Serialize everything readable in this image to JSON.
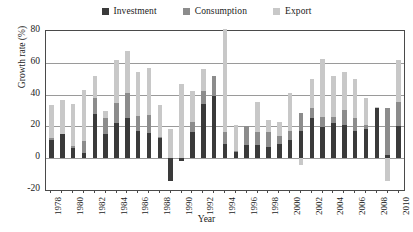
{
  "chart_data": {
    "type": "bar",
    "subtype": "stacked-column",
    "title": "",
    "xlabel": "Year",
    "ylabel": "Growth rate (%)",
    "ylim": [
      -20,
      80
    ],
    "yticks": [
      80,
      60,
      40,
      20,
      0,
      -20
    ],
    "grid": true,
    "legend_position": "top-center",
    "categories": [
      "1978",
      "1979",
      "1980",
      "1981",
      "1982",
      "1983",
      "1984",
      "1985",
      "1986",
      "1987",
      "1988",
      "1989",
      "1990",
      "1991",
      "1992",
      "1993",
      "1994",
      "1995",
      "1996",
      "1997",
      "1998",
      "1999",
      "2000",
      "2001",
      "2002",
      "2003",
      "2004",
      "2005",
      "2006",
      "2007",
      "2008",
      "2009",
      "2010"
    ],
    "xtick_labels": [
      "1978",
      "1980",
      "1982",
      "1984",
      "1986",
      "1988",
      "1990",
      "1992",
      "1994",
      "1996",
      "1998",
      "2000",
      "2002",
      "2004",
      "2006",
      "2008",
      "2010"
    ],
    "series": [
      {
        "name": "Investment",
        "color": "#3a3a3a",
        "values": [
          11.5,
          15.5,
          6.5,
          3.5,
          28.0,
          15.0,
          22.0,
          25.5,
          17.0,
          16.0,
          12.5,
          -14.5,
          -2.0,
          16.5,
          34.0,
          39.0,
          9.0,
          4.0,
          8.5,
          8.0,
          7.0,
          9.0,
          11.5,
          17.0,
          25.0,
          19.5,
          22.0,
          21.0,
          17.0,
          18.5,
          31.5,
          2.0,
          20.5
        ]
      },
      {
        "name": "Consumption",
        "color": "#8c8c8c",
        "values": [
          1.0,
          0.0,
          1.0,
          7.5,
          10.0,
          10.5,
          13.0,
          15.5,
          9.5,
          11.0,
          1.0,
          0.0,
          0.0,
          6.5,
          8.5,
          12.5,
          7.5,
          0.5,
          12.0,
          8.5,
          9.5,
          5.0,
          5.5,
          11.5,
          6.5,
          6.5,
          4.0,
          9.5,
          8.5,
          2.5,
          0.5,
          29.5,
          15.0
        ]
      },
      {
        "name": "Export",
        "color": "#c8c8c8",
        "values": [
          21.0,
          21.0,
          26.5,
          32.0,
          13.5,
          4.5,
          26.5,
          26.5,
          27.5,
          29.5,
          20.0,
          18.5,
          46.5,
          19.5,
          13.5,
          0.0,
          65.0,
          16.5,
          0.0,
          19.0,
          7.5,
          8.5,
          24.0,
          -4.5,
          18.5,
          36.5,
          26.0,
          23.5,
          24.5,
          17.0,
          0.5,
          -14.5,
          26.0
        ]
      }
    ],
    "totals": [
      33.5,
      36.5,
      34.0,
      43.0,
      51.5,
      30.0,
      61.5,
      67.5,
      54.0,
      56.5,
      33.5,
      4.0,
      44.5,
      42.5,
      56.0,
      51.5,
      81.5,
      21.0,
      20.5,
      35.5,
      24.0,
      22.5,
      41.0,
      24.0,
      50.0,
      62.5,
      52.0,
      54.0,
      50.0,
      38.0,
      32.5,
      46.5,
      61.5
    ]
  },
  "legend": {
    "entries": [
      {
        "label": "Investment"
      },
      {
        "label": "Consumption"
      },
      {
        "label": "Export"
      }
    ]
  }
}
